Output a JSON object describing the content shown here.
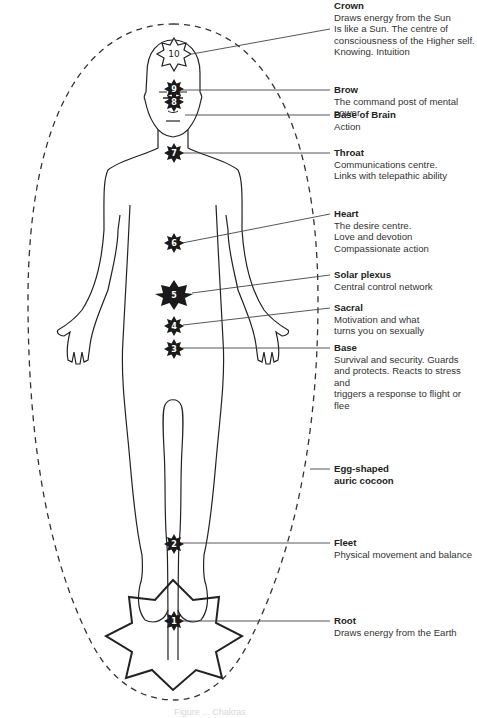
{
  "diagram": {
    "type": "chakra body diagram",
    "figure": "standing human figure inside egg-shaped dashed aura",
    "colors": {
      "line": "#222222",
      "chakra_fill": "#1a1a1a",
      "text": "#333333",
      "background": "#ffffff"
    },
    "chakras": [
      {
        "number": "10",
        "name": "Crown",
        "lines": [
          "Draws energy from the Sun",
          "Is like a Sun. The centre of",
          "consciousness of the Higher self.",
          "Knowing. Intuition"
        ]
      },
      {
        "number": "9",
        "name": "Brow",
        "lines": [
          "The command post of mental power"
        ]
      },
      {
        "number": "8",
        "name": "Base of Brain",
        "lines": [
          "Action"
        ]
      },
      {
        "number": "7",
        "name": "Throat",
        "lines": [
          "Communications centre.",
          "Links with telepathic ability"
        ]
      },
      {
        "number": "6",
        "name": "Heart",
        "lines": [
          "The desire centre.",
          "Love and devotion",
          "Compassionate action"
        ]
      },
      {
        "number": "5",
        "name": "Solar plexus",
        "lines": [
          "Central control network"
        ]
      },
      {
        "number": "4",
        "name": "Sacral",
        "lines": [
          "Motivation and what",
          "turns you on sexually"
        ]
      },
      {
        "number": "3",
        "name": "Base",
        "lines": [
          "Survival and security. Guards",
          "and protects. Reacts to stress and",
          "triggers a response to flight or flee"
        ]
      },
      {
        "number": "2",
        "name": "Fleet",
        "lines": [
          "Physical movement and balance"
        ]
      },
      {
        "number": "1",
        "name": "Root",
        "lines": [
          "Draws energy from the Earth"
        ]
      }
    ],
    "aura_label": [
      "Egg-shaped",
      "auric cocoon"
    ],
    "caption": "Figure ... Chakras"
  }
}
